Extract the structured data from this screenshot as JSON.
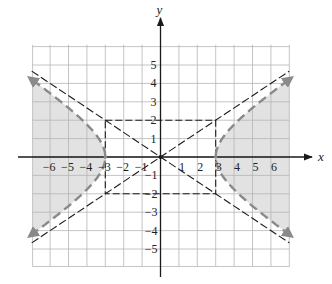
{
  "chart_data": {
    "type": "line",
    "title": "",
    "xlabel": "x",
    "ylabel": "y",
    "xlim": [
      -7,
      7
    ],
    "ylim": [
      -6,
      6
    ],
    "grid": true,
    "x_ticks": [
      "-6",
      "-5",
      "-4",
      "-3",
      "-2",
      "-1",
      "1",
      "2",
      "3",
      "4",
      "5",
      "6"
    ],
    "y_ticks": [
      "5",
      "4",
      "3",
      "2",
      "1",
      "-1",
      "-2",
      "-3",
      "-4",
      "-5"
    ],
    "series": [
      {
        "name": "hyperbola x^2/9 - y^2/4 = 1 (dashed boundary)",
        "equation": "x^2/9 - y^2/4 = 1",
        "style": "gray dashed",
        "vertices": [
          [
            -3,
            0
          ],
          [
            3,
            0
          ]
        ]
      },
      {
        "name": "asymptote y = 2x/3",
        "equation": "y = (2/3)x",
        "style": "black dashed"
      },
      {
        "name": "asymptote y = -2x/3",
        "equation": "y = -(2/3)x",
        "style": "black dashed"
      },
      {
        "name": "fundamental rectangle",
        "corners": [
          [
            -3,
            2
          ],
          [
            3,
            2
          ],
          [
            3,
            -2
          ],
          [
            -3,
            -2
          ]
        ],
        "style": "black dashed"
      }
    ],
    "shaded_region": "x^2/9 - y^2/4 > 1",
    "shade_color": "#e2e2e2"
  },
  "labels": {
    "x_axis": "x",
    "y_axis": "y",
    "x_ticks_neg": [
      "−6",
      "−5",
      "−4",
      "−3",
      "−2",
      "−1"
    ],
    "x_ticks_pos": [
      "1",
      "2",
      "3",
      "4",
      "5",
      "6"
    ],
    "y_ticks_pos": [
      "5",
      "4",
      "3",
      "2",
      "1"
    ],
    "y_ticks_neg": [
      "−1",
      "−2",
      "−3",
      "−4",
      "−5"
    ]
  },
  "colors": {
    "grid": "#b5b5b5",
    "shade": "#e2e2e2",
    "hyperbola": "#8a8a8a",
    "asymptote": "#1a1a1a",
    "axis": "#1a1a1a"
  }
}
